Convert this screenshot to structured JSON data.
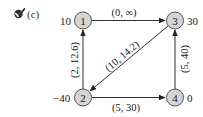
{
  "header": {
    "icon": "checkmark-icon",
    "part_label": "(c)"
  },
  "nodes": [
    {
      "id": "1",
      "label": "1",
      "supply": "10",
      "supply_side": "left"
    },
    {
      "id": "2",
      "label": "2",
      "supply": "−40",
      "supply_side": "left"
    },
    {
      "id": "3",
      "label": "3",
      "supply": "30",
      "supply_side": "right"
    },
    {
      "id": "4",
      "label": "4",
      "supply": "0",
      "supply_side": "right"
    }
  ],
  "edges": [
    {
      "from": "1",
      "to": "3",
      "label": "(0, ∞)"
    },
    {
      "from": "2",
      "to": "1",
      "label": "(2, 12.6)"
    },
    {
      "from": "3",
      "to": "2",
      "label": "(10, 14.2)"
    },
    {
      "from": "2",
      "to": "4",
      "label": "(5, 30)"
    },
    {
      "from": "4",
      "to": "3",
      "label": "(5, 40)"
    }
  ],
  "colors": {
    "node_fill": "#d4d4d4",
    "node_stroke": "#555555",
    "edge": "#333333",
    "text": "#1a1a1a"
  }
}
